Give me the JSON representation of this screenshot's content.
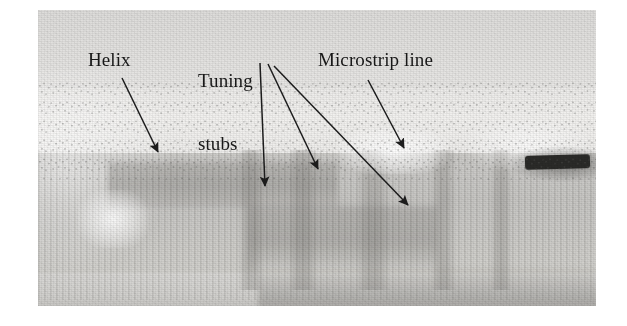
{
  "figure": {
    "kind": "annotated-photograph",
    "caption_labels": [
      {
        "id": "helix",
        "text": "Helix"
      },
      {
        "id": "tuning",
        "text": "Tuning\nstubs"
      },
      {
        "id": "microstrip",
        "text": "Microstrip line"
      }
    ],
    "label_helix": "Helix",
    "label_tuning_line1": "Tuning",
    "label_tuning_line2": "stubs",
    "label_microstrip": "Microstrip line",
    "bleed_through_text": "",
    "colors": {
      "ink": "#181818",
      "arrow": "#1c1c1c",
      "plate_light": "#eeedeb",
      "plate_mid": "#c6c5c2",
      "plate_dark": "#2a2a28",
      "page": "#ffffff"
    },
    "photo_plate": {
      "x": 38,
      "y": 10,
      "width": 558,
      "height": 296
    },
    "arrows": [
      {
        "id": "arrow-helix",
        "from": [
          122,
          78
        ],
        "to": [
          160,
          155
        ],
        "label": "Helix"
      },
      {
        "id": "arrow-stub-1",
        "from": [
          260,
          63
        ],
        "to": [
          265,
          190
        ],
        "label": "Tuning stubs"
      },
      {
        "id": "arrow-stub-2",
        "from": [
          268,
          64
        ],
        "to": [
          320,
          172
        ],
        "label": "Tuning stubs"
      },
      {
        "id": "arrow-stub-3",
        "from": [
          273,
          65
        ],
        "to": [
          411,
          208
        ],
        "label": "Tuning stubs"
      },
      {
        "id": "arrow-microstrip",
        "from": [
          368,
          80
        ],
        "to": [
          406,
          151
        ],
        "label": "Microstrip line"
      }
    ]
  }
}
